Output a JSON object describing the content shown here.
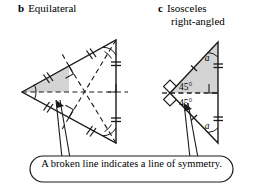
{
  "figure": {
    "panels": [
      {
        "id": "b",
        "letter": "b",
        "title": "Equilateral",
        "shape": "equilateral-triangle",
        "lines_of_symmetry": 3,
        "equal_side_ticks": 2,
        "shaded_region": true,
        "right_angle_marks": 3
      },
      {
        "id": "c",
        "letter": "c",
        "title_line1": "Isosceles",
        "title_line2": "right-angled",
        "shape": "isosceles-right-angled-triangle",
        "lines_of_symmetry": 1,
        "equal_side_ticks": 1,
        "angles": {
          "upper": "45°",
          "lower": "45°",
          "upper_side": "a",
          "lower_side": "a"
        },
        "right_angle_marks": 2
      }
    ],
    "caption": "A broken line indicates a line of symmetry.",
    "colors": {
      "stroke": "#1a1a1a",
      "shade": "#d4d4d4",
      "background": "#ffffff"
    }
  }
}
